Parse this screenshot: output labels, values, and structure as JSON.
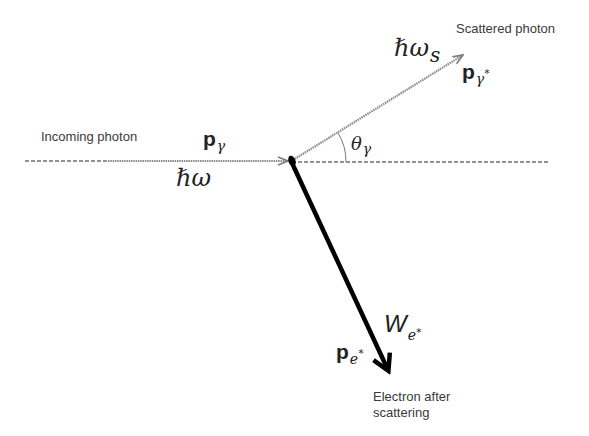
{
  "diagram": {
    "type": "compton-scattering",
    "colors": {
      "photon_line": "#7a7a7a",
      "dashed_axis": "#6f6f6f",
      "electron_arrow": "#000000",
      "text": "#3a3a3a",
      "background": "#ffffff"
    },
    "labels": {
      "incoming_photon": "Incoming photon",
      "scattered_photon": "Scattered photon",
      "electron_after_line1": "Electron after",
      "electron_after_line2": "scattering"
    },
    "math": {
      "p_gamma": {
        "base": "p",
        "sub": "γ"
      },
      "hbar_omega": "ℏω",
      "hbar_omega_s": {
        "base": "ℏω",
        "sub": "s"
      },
      "p_gamma_star": {
        "base": "p",
        "sub": "γ",
        "sup": "*"
      },
      "theta_gamma": {
        "base": "θ",
        "sub": "γ"
      },
      "W_e_star": {
        "base": "W",
        "sub": "e",
        "sup": "*"
      },
      "p_e_star": {
        "base": "p",
        "sub": "e",
        "sup": "*"
      }
    },
    "geometry": {
      "origin": [
        292,
        161
      ],
      "incoming_start_x": 25,
      "incoming_arrow_start_x": 108,
      "axis_end_x": 549,
      "scattered_tip": [
        464,
        54
      ],
      "electron_tip": [
        391,
        376
      ]
    }
  }
}
